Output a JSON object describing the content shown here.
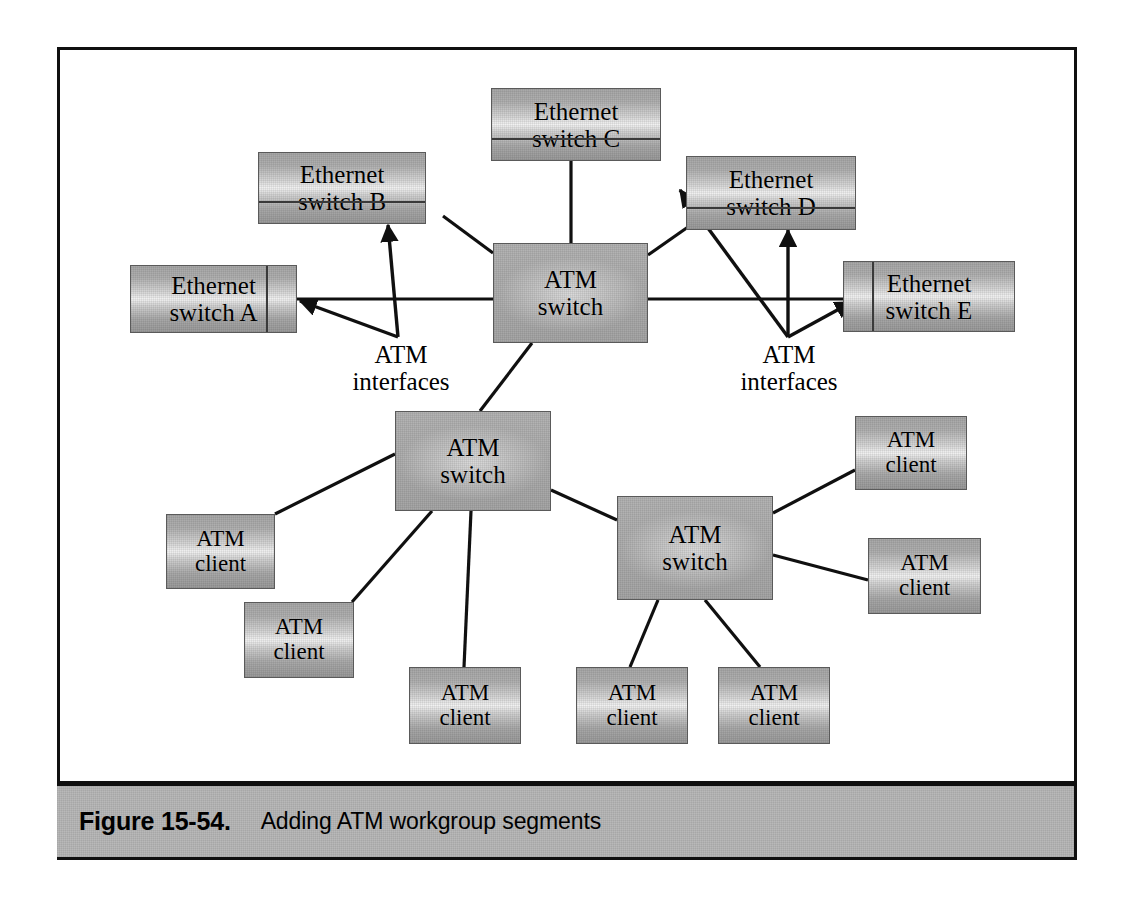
{
  "figure": {
    "caption_number": "Figure 15-54.",
    "caption_text": "Adding ATM workgroup segments"
  },
  "nodes": {
    "ethernet_switch_a": {
      "label": "Ethernet\nswitch A",
      "type": "ethernet-switch"
    },
    "ethernet_switch_b": {
      "label": "Ethernet\nswitch B",
      "type": "ethernet-switch"
    },
    "ethernet_switch_c": {
      "label": "Ethernet\nswitch C",
      "type": "ethernet-switch"
    },
    "ethernet_switch_d": {
      "label": "Ethernet\nswitch D",
      "type": "ethernet-switch"
    },
    "ethernet_switch_e": {
      "label": "Ethernet\nswitch E",
      "type": "ethernet-switch"
    },
    "atm_switch_core": {
      "label": "ATM\nswitch",
      "type": "atm-switch"
    },
    "atm_switch_left": {
      "label": "ATM\nswitch",
      "type": "atm-switch"
    },
    "atm_switch_right": {
      "label": "ATM\nswitch",
      "type": "atm-switch"
    },
    "atm_client_1": {
      "label": "ATM\nclient",
      "type": "atm-client"
    },
    "atm_client_2": {
      "label": "ATM\nclient",
      "type": "atm-client"
    },
    "atm_client_3": {
      "label": "ATM\nclient",
      "type": "atm-client"
    },
    "atm_client_4": {
      "label": "ATM\nclient",
      "type": "atm-client"
    },
    "atm_client_5": {
      "label": "ATM\nclient",
      "type": "atm-client"
    },
    "atm_client_6": {
      "label": "ATM\nclient",
      "type": "atm-client"
    },
    "atm_client_7": {
      "label": "ATM\nclient",
      "type": "atm-client"
    }
  },
  "annotations": {
    "atm_interfaces_left": "ATM\ninterfaces",
    "atm_interfaces_right": "ATM\ninterfaces"
  },
  "colors": {
    "frame_border": "#101010",
    "caption_bar_fill": "#b9b9b9",
    "node_fill_light": "#f2f2f2",
    "node_fill_dark": "#a8a8a8",
    "link_stroke": "#101010",
    "page_background": "#ffffff"
  }
}
